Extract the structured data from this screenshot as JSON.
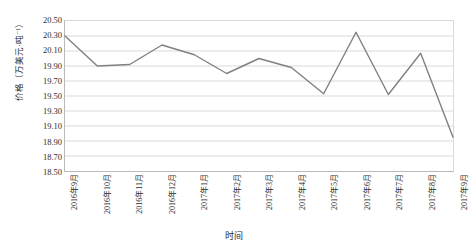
{
  "chart_data": {
    "type": "line",
    "title": "",
    "xlabel": "时间",
    "ylabel": "价格（万美元·吨⁻¹）",
    "categories": [
      "2016年9月",
      "2016年10月",
      "2016年11月",
      "2016年12月",
      "2017年1月",
      "2017年2月",
      "2017年3月",
      "2017年4月",
      "2017年5月",
      "2017年6月",
      "2017年7月",
      "2017年8月",
      "2017年9月"
    ],
    "values": [
      20.3,
      19.9,
      19.92,
      20.18,
      20.05,
      19.8,
      20.0,
      19.88,
      19.53,
      20.35,
      19.52,
      20.07,
      18.95
    ],
    "ylim": [
      18.5,
      20.5
    ],
    "ytick_step": 0.2,
    "yticks": [
      "20.50",
      "20.30",
      "20.10",
      "19.90",
      "19.70",
      "19.50",
      "19.30",
      "19.10",
      "18.90",
      "18.70",
      "18.50"
    ],
    "grid": "horizontal",
    "legend": "none",
    "line_color": "#808080",
    "grid_color": "#d9d9d9",
    "axis_color": "#b9b9b9"
  }
}
